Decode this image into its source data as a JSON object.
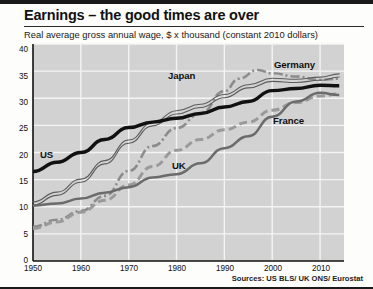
{
  "header": {
    "title": "Earnings – the good times are over",
    "subtitle": "Real average gross annual wage, $ x thousand (constant 2010 dollars)"
  },
  "footer": {
    "source": "Sources: US BLS/ UK ONS/ Eurostat"
  },
  "colors": {
    "plot_background": "#d2d2d2",
    "gridline": "#f4f4f4",
    "axis": "#111111",
    "us_line": "#111111",
    "japan_line": "#8c8c8c",
    "germany_line": "#5d5d5d",
    "uk_line": "#6b6b6b",
    "france_line": "#9a9a9a",
    "page_background": "#fdfdfb"
  },
  "chart_data": {
    "type": "line",
    "title": "Earnings – the good times are over",
    "subtitle": "Real average gross annual wage, $ x thousand (constant 2010 dollars)",
    "xlabel": "",
    "ylabel": "$ x thousand (constant 2010 dollars)",
    "xlim": [
      1950,
      2015
    ],
    "ylim": [
      0,
      40
    ],
    "yticks": [
      0,
      5,
      10,
      15,
      20,
      25,
      30,
      35,
      40
    ],
    "xticks": [
      1950,
      1960,
      1970,
      1980,
      1990,
      2000,
      2010
    ],
    "grid": true,
    "legend": "inline-annotations",
    "series": [
      {
        "name": "US",
        "style": "thick-solid-black",
        "label_position": {
          "x": 1953,
          "y": 19.2
        },
        "x": [
          1950,
          1955,
          1960,
          1965,
          1970,
          1975,
          1980,
          1985,
          1990,
          1995,
          2000,
          2005,
          2010,
          2014
        ],
        "values": [
          16.5,
          18.2,
          20.0,
          22.4,
          24.6,
          25.6,
          26.3,
          27.2,
          28.4,
          29.4,
          31.4,
          31.8,
          32.4,
          32.3
        ]
      },
      {
        "name": "Japan",
        "style": "dash-dot-grey",
        "label_position": {
          "x": 1979,
          "y": 35.0
        },
        "x": [
          1950,
          1955,
          1960,
          1965,
          1970,
          1975,
          1980,
          1985,
          1990,
          1993,
          1997,
          2000,
          2005,
          2010,
          2014
        ],
        "values": [
          6.3,
          7.6,
          9.2,
          12.0,
          16.6,
          21.2,
          24.5,
          27.2,
          31.3,
          33.6,
          35.2,
          34.6,
          34.0,
          33.4,
          33.6
        ]
      },
      {
        "name": "Germany",
        "style": "thin-double-line",
        "label_position": {
          "x": 2001,
          "y": 37.6
        },
        "x": [
          1950,
          1955,
          1960,
          1965,
          1970,
          1975,
          1980,
          1985,
          1990,
          1995,
          2000,
          2005,
          2010,
          2014
        ],
        "values": [
          10.6,
          12.4,
          14.8,
          18.2,
          22.0,
          25.2,
          27.4,
          28.6,
          30.4,
          32.2,
          33.4,
          33.2,
          33.6,
          34.2
        ]
      },
      {
        "name": "UK",
        "style": "medium-solid-grey",
        "label_position": {
          "x": 1978,
          "y": 16.6
        },
        "x": [
          1950,
          1955,
          1960,
          1965,
          1970,
          1975,
          1980,
          1985,
          1990,
          1995,
          2000,
          2005,
          2010,
          2014
        ],
        "values": [
          10.2,
          10.6,
          11.5,
          12.6,
          13.6,
          15.4,
          16.0,
          18.0,
          20.8,
          23.0,
          26.6,
          29.4,
          31.0,
          30.6
        ]
      },
      {
        "name": "France",
        "style": "thick-dashed-grey",
        "label_position": {
          "x": 2000,
          "y": 25.6
        },
        "x": [
          1950,
          1955,
          1960,
          1965,
          1970,
          1975,
          1980,
          1985,
          1990,
          1995,
          2000,
          2005,
          2010,
          2014
        ],
        "values": [
          6.0,
          7.2,
          9.0,
          11.2,
          14.0,
          17.4,
          20.4,
          22.4,
          24.2,
          25.6,
          27.8,
          29.2,
          30.4,
          30.8
        ]
      }
    ]
  },
  "axis": {
    "y_labels": [
      "40",
      "35",
      "30",
      "25",
      "20",
      "15",
      "10",
      "5",
      "0"
    ],
    "x_labels": [
      "1950",
      "1960",
      "1970",
      "1980",
      "1990",
      "2000",
      "2010"
    ]
  },
  "annotations": [
    {
      "text": "US"
    },
    {
      "text": "Japan"
    },
    {
      "text": "Germany"
    },
    {
      "text": "UK"
    },
    {
      "text": "France"
    }
  ]
}
